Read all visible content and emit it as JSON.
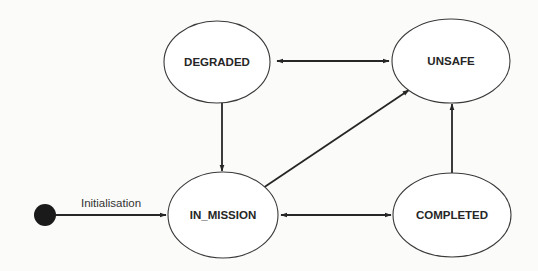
{
  "diagram": {
    "type": "state-machine",
    "colors": {
      "stroke": "#262626",
      "state_fill": "#ffffff",
      "initial_node": "#1a1a1a",
      "background": "#fbfbf9"
    },
    "initial": {
      "label": "Initialisation",
      "target": "IN_MISSION"
    },
    "states": {
      "degraded": {
        "label": "DEGRADED"
      },
      "unsafe": {
        "label": "UNSAFE"
      },
      "in_mission": {
        "label": "IN_MISSION"
      },
      "completed": {
        "label": "COMPLETED"
      }
    },
    "transitions": [
      {
        "from": "DEGRADED",
        "to": "UNSAFE",
        "bidirectional": true
      },
      {
        "from": "DEGRADED",
        "to": "IN_MISSION",
        "bidirectional": false
      },
      {
        "from": "IN_MISSION",
        "to": "UNSAFE",
        "bidirectional": false
      },
      {
        "from": "IN_MISSION",
        "to": "COMPLETED",
        "bidirectional": true
      },
      {
        "from": "COMPLETED",
        "to": "UNSAFE",
        "bidirectional": false
      },
      {
        "from": "INITIAL",
        "to": "IN_MISSION",
        "label": "Initialisation",
        "bidirectional": false
      }
    ]
  }
}
